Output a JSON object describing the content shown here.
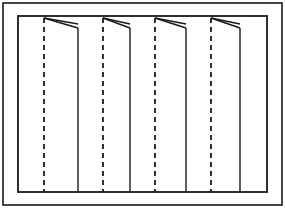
{
  "figure": {
    "title": "Vertical blind panel elevation diagram",
    "type": "technical-line-drawing",
    "canvas": {
      "width": 285,
      "height": 208
    },
    "background_color": "#ffffff",
    "line_color": "#1a1a1a",
    "outer_border": {
      "name": "outer-frame",
      "x": 3,
      "y": 3,
      "width": 279,
      "height": 202,
      "stroke_width": 1.6
    },
    "inner_border": {
      "name": "inner-frame",
      "x": 18,
      "y": 16,
      "width": 249,
      "height": 176,
      "stroke_width": 1.8
    },
    "panels": [
      {
        "index": 1,
        "label": "panel-1",
        "left_edge_x": 18,
        "right_edge_x": 78,
        "dashed_center_x": 44,
        "flap_apex_x": 44,
        "flap_apex_y": 18,
        "flap_tip_x": 78,
        "flap_tip_y": 28,
        "top_y": 16,
        "bottom_y": 192
      },
      {
        "index": 2,
        "label": "panel-2",
        "left_edge_x": 78,
        "right_edge_x": 130,
        "dashed_center_x": 103,
        "flap_apex_x": 103,
        "flap_apex_y": 18,
        "flap_tip_x": 130,
        "flap_tip_y": 28,
        "top_y": 16,
        "bottom_y": 192
      },
      {
        "index": 3,
        "label": "panel-3",
        "left_edge_x": 130,
        "right_edge_x": 186,
        "dashed_center_x": 155,
        "flap_apex_x": 155,
        "flap_apex_y": 18,
        "flap_tip_x": 186,
        "flap_tip_y": 28,
        "top_y": 16,
        "bottom_y": 192
      },
      {
        "index": 4,
        "label": "panel-4",
        "left_edge_x": 186,
        "right_edge_x": 240,
        "dashed_center_x": 211,
        "flap_apex_x": 211,
        "flap_apex_y": 18,
        "flap_tip_x": 240,
        "flap_tip_y": 28,
        "top_y": 16,
        "bottom_y": 192
      }
    ],
    "dash_pattern": "5,4",
    "dash_stroke_width": 1.8,
    "panel_edge_stroke_width": 1.4,
    "flap_stroke_width": 1.3,
    "labels": []
  }
}
